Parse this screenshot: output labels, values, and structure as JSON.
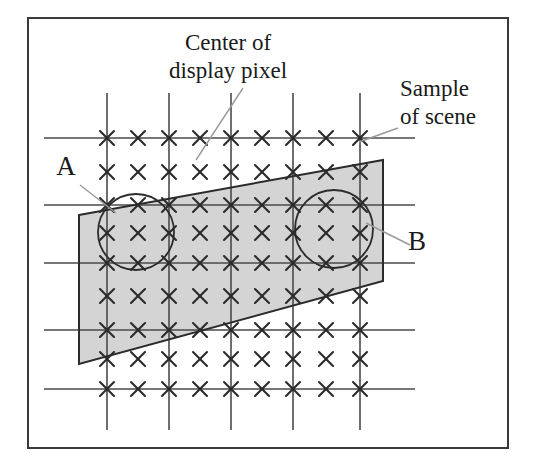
{
  "figure": {
    "kind": "sampling-grid-diagram",
    "background_color": "#ffffff",
    "ink_color": "#2b2b2b",
    "shade_color": "#d4d4d4",
    "border": {
      "name": "figure-border",
      "x": 28,
      "y": 18,
      "width": 480,
      "height": 430,
      "stroke": "#3a3a3a",
      "stroke_width": 2
    },
    "labels": {
      "center_of_display_pixel": {
        "line1": "Center of",
        "line2": "display pixel",
        "x": 228,
        "y1": 50,
        "y2": 78
      },
      "sample_of_scene": {
        "line1": "Sample",
        "line2": "of scene",
        "x": 400,
        "y1": 96,
        "y2": 124
      },
      "point_a": {
        "text": "A",
        "x": 66,
        "y": 175
      },
      "point_b": {
        "text": "B",
        "x": 417,
        "y": 250
      }
    },
    "leaders": [
      {
        "name": "leader-center-of-display-pixel",
        "x1": 243,
        "y1": 88,
        "x2": 196,
        "y2": 160
      },
      {
        "name": "leader-sample-of-scene",
        "x1": 398,
        "y1": 128,
        "x2": 359,
        "y2": 142
      },
      {
        "name": "leader-point-a",
        "x1": 80,
        "y1": 185,
        "x2": 116,
        "y2": 213
      },
      {
        "name": "leader-point-b",
        "x1": 410,
        "y1": 245,
        "x2": 366,
        "y2": 223
      }
    ],
    "grid": {
      "name": "pixel-grid",
      "vertical_lines_x": [
        107,
        169,
        231,
        293,
        360
      ],
      "vertical_span": [
        93,
        430
      ],
      "horizontal_lines_y": [
        138,
        205,
        263,
        330,
        389
      ],
      "horizontal_span": [
        44,
        415
      ],
      "stroke": "#4a4a4a",
      "stroke_width": 1.6
    },
    "samples": {
      "name": "scene-sample-marks",
      "glyph": "x-mark",
      "columns_x": [
        107,
        138,
        169,
        200,
        231,
        262,
        293,
        326,
        360
      ],
      "rows_y": [
        138,
        172,
        205,
        233,
        263,
        296,
        330,
        359,
        389
      ],
      "arm": 7,
      "stroke": "#2b2b2b",
      "stroke_width": 2.1
    },
    "shaded_region": {
      "name": "scene-sample-band",
      "fill": "#d4d4d4",
      "stroke": "#2b2b2b",
      "stroke_width": 2,
      "points": "79,215 383,160 383,281 79,364"
    },
    "circles": [
      {
        "name": "pixel-footprint-a",
        "cx": 136,
        "cy": 232,
        "r": 38,
        "stroke": "#2b2b2b",
        "stroke_width": 1.8
      },
      {
        "name": "pixel-footprint-b",
        "cx": 334,
        "cy": 229,
        "r": 39,
        "stroke": "#2b2b2b",
        "stroke_width": 1.8
      }
    ]
  }
}
